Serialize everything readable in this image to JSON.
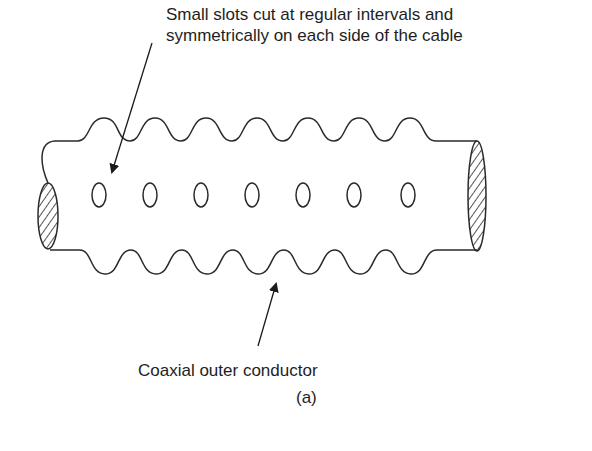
{
  "figure": {
    "top_annotation": {
      "line1": "Small slots cut at regular intervals and",
      "line2": "symmetrically on each side of the cable"
    },
    "bottom_annotation": "Coaxial outer conductor",
    "caption": "(a)",
    "slot_count": 7,
    "stroke_color": "#2a2a2a",
    "background": "#ffffff"
  }
}
